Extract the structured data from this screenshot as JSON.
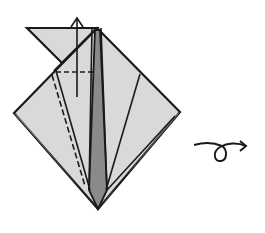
{
  "diagram": {
    "colors": {
      "paper_light": "#d9d9d9",
      "paper_dark": "#8a8a8a",
      "line": "#1a1a1a",
      "background": "#ffffff"
    },
    "elements": {
      "model": "Folded diamond base with dark center strip",
      "top_flap": "Triangular flap extending to upper left",
      "fold_arrow": "Upward arrow indicating fold direction",
      "valley_fold_horizontal": "Dashed valley-fold line",
      "valley_fold_diagonal": "Dashed diagonal valley-fold line",
      "turn_over_symbol": "Loop arrow: turn model over"
    }
  }
}
